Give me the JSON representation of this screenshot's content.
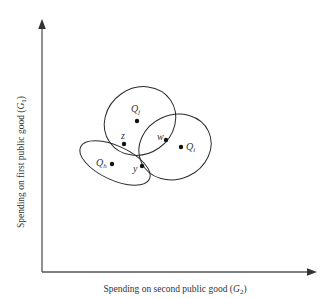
{
  "axes": {
    "x_label": "Spending on second public good (",
    "x_var": "G",
    "x_sub": "2",
    "y_label": "Spending on first public good (",
    "y_var": "G",
    "y_sub": "1",
    "close_paren": ")"
  },
  "points": {
    "Qj": {
      "name": "Q",
      "sub": "j"
    },
    "Qi": {
      "name": "Q",
      "sub": "i"
    },
    "Qh": {
      "name": "Q",
      "sub": "h"
    },
    "z": {
      "name": "z"
    },
    "w": {
      "name": "w"
    },
    "y": {
      "name": "y"
    }
  },
  "colors": {
    "line": "#2a2a2a",
    "axis": "#555555"
  }
}
